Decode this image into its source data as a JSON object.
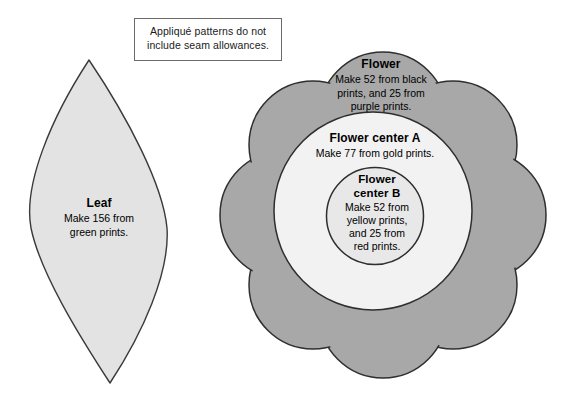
{
  "page": {
    "width": 571,
    "height": 406,
    "background": "#ffffff"
  },
  "note": {
    "line1": "Appliqué patterns do not",
    "line2": "include seam allowances."
  },
  "pieces": [
    {
      "id": "leaf",
      "title": "Leaf",
      "instruction_line1": "Make 156 from",
      "instruction_line2": "green prints.",
      "shape": "pointed-oval",
      "fill": "#e3e3e3",
      "stroke": "#3a3a3a"
    },
    {
      "id": "flower",
      "title": "Flower",
      "instruction_line1": "Make 52 from black",
      "instruction_line2": "prints, and 25 from",
      "instruction_line3": "purple prints.",
      "shape": "eight-petal-flower",
      "fill": "#a8a8a8",
      "stroke": "#2e2e2e"
    },
    {
      "id": "flower-center-a",
      "title": "Flower center A",
      "instruction_line1": "Make 77 from gold prints.",
      "shape": "circle",
      "fill": "#f2f2f2",
      "stroke": "#2e2e2e"
    },
    {
      "id": "flower-center-b",
      "title": "Flower",
      "title_line2": "center B",
      "instruction_line1": "Make 52 from",
      "instruction_line2": "yellow prints,",
      "instruction_line3": "and 25 from",
      "instruction_line4": "red prints.",
      "shape": "circle",
      "fill": "#e8e8e8",
      "stroke": "#2e2e2e"
    }
  ],
  "colors": {
    "leaf_fill": "#e3e3e3",
    "petal_fill": "#a8a8a8",
    "center_a_fill": "#f2f2f2",
    "center_b_fill": "#e8e8e8",
    "outline": "#2e2e2e",
    "note_border": "#6b6b6b",
    "text": "#000000"
  }
}
